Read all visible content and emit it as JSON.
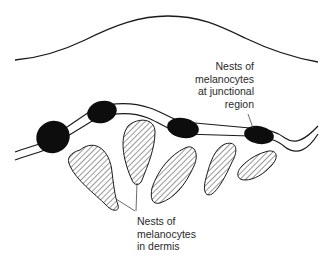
{
  "diagram": {
    "type": "histology-schematic",
    "elements": {
      "skin_surface": "epidermal surface curve",
      "junction": "dermo-epidermal junction (double line)",
      "junctional_nests_count": 4,
      "dermal_nests_count": 5
    },
    "colors": {
      "line": "#1a1a1a",
      "nest_fill": "#0d0d0d",
      "hatch": "#333333",
      "text": "#2a2a2a",
      "background": "#ffffff"
    }
  },
  "labels": {
    "junctional": {
      "lines": [
        "Nests of",
        "melanocytes",
        "at junctional",
        "region"
      ]
    },
    "dermis": {
      "lines": [
        "Nests of",
        "melanocytes",
        "in dermis"
      ]
    }
  }
}
